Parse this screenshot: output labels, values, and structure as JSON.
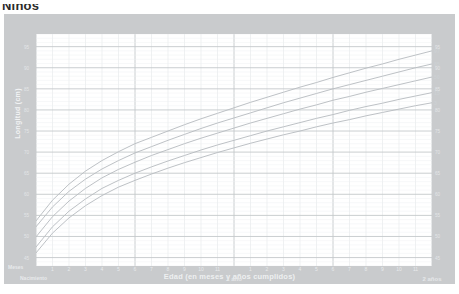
{
  "page_title": "Niños",
  "chart_card": {
    "frame_color": "#c9cbcd",
    "plot_background": "#ffffff"
  },
  "axes": {
    "y_title": "Longitud (cm)",
    "x_title": "Edad (en meses y años cumplidos)",
    "x_unit_label": "Meses",
    "birth_label": "Nacimiento",
    "era_labels": [
      "1 año",
      "2 años"
    ],
    "x_month_ticks": [
      "1",
      "2",
      "3",
      "4",
      "5",
      "6",
      "7",
      "8",
      "9",
      "10",
      "11",
      "1",
      "2",
      "3",
      "4",
      "5",
      "6",
      "7",
      "8",
      "9",
      "10",
      "11"
    ],
    "y_ticks": [
      "45",
      "50",
      "55",
      "60",
      "65",
      "70",
      "75",
      "80",
      "85",
      "90",
      "95"
    ]
  },
  "percentiles": {
    "labels": [
      "97",
      "85",
      "50",
      "15",
      "3"
    ],
    "color": "#cfd3d6"
  },
  "chart_data": {
    "type": "line",
    "title": "Niños",
    "xlabel": "Edad (en meses y años cumplidos)",
    "ylabel": "Longitud (cm)",
    "xlim": [
      0,
      24
    ],
    "ylim": [
      43,
      98
    ],
    "grid": true,
    "legend_position": "right-inline",
    "x": [
      0,
      1,
      2,
      3,
      4,
      5,
      6,
      7,
      8,
      9,
      10,
      11,
      12,
      13,
      14,
      15,
      16,
      17,
      18,
      19,
      20,
      21,
      22,
      23,
      24
    ],
    "series": [
      {
        "name": "97",
        "values": [
          53.7,
          58.6,
          62.4,
          65.5,
          68.0,
          70.1,
          72.0,
          73.5,
          75.0,
          76.5,
          77.9,
          79.2,
          80.5,
          81.8,
          83.0,
          84.2,
          85.4,
          86.5,
          87.7,
          88.8,
          89.9,
          90.9,
          92.0,
          93.0,
          94.0
        ]
      },
      {
        "name": "85",
        "values": [
          52.3,
          57.0,
          60.7,
          63.6,
          66.0,
          68.0,
          69.8,
          71.3,
          72.8,
          74.2,
          75.6,
          76.9,
          78.1,
          79.3,
          80.5,
          81.7,
          82.8,
          83.9,
          85.0,
          86.0,
          87.0,
          88.0,
          89.0,
          90.0,
          90.9
        ]
      },
      {
        "name": "50",
        "values": [
          49.9,
          54.7,
          58.4,
          61.4,
          63.9,
          65.9,
          67.6,
          69.2,
          70.6,
          72.0,
          73.3,
          74.5,
          75.7,
          76.9,
          78.0,
          79.1,
          80.2,
          81.2,
          82.3,
          83.2,
          84.2,
          85.1,
          86.0,
          86.9,
          87.8
        ]
      },
      {
        "name": "15",
        "values": [
          47.5,
          52.3,
          56.0,
          58.9,
          61.4,
          63.3,
          65.0,
          66.5,
          67.9,
          69.2,
          70.5,
          71.7,
          72.8,
          73.9,
          75.0,
          76.0,
          77.0,
          78.0,
          78.9,
          79.9,
          80.8,
          81.6,
          82.5,
          83.3,
          84.1
        ]
      },
      {
        "name": "3",
        "values": [
          46.1,
          50.8,
          54.4,
          57.3,
          59.7,
          61.7,
          63.3,
          64.8,
          66.2,
          67.5,
          68.7,
          69.9,
          71.0,
          72.1,
          73.1,
          74.1,
          75.0,
          76.0,
          76.9,
          77.7,
          78.6,
          79.4,
          80.2,
          81.0,
          81.7
        ]
      }
    ]
  }
}
